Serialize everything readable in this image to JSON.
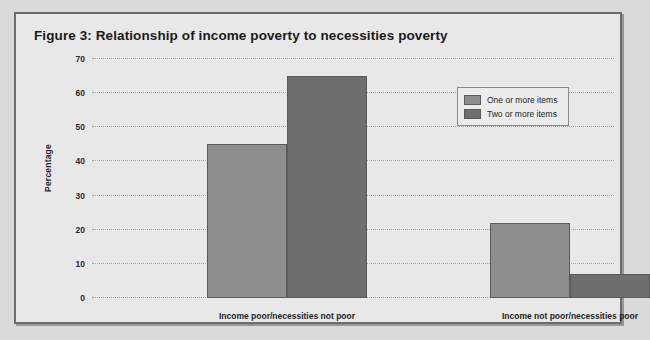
{
  "figure": {
    "title": "Figure 3:  Relationship of income poverty to necessities poverty"
  },
  "chart_data": {
    "type": "bar",
    "title": "Figure 3:  Relationship of income poverty to necessities poverty",
    "xlabel": "",
    "ylabel": "Percentage",
    "ylim": [
      0,
      70
    ],
    "yticks": [
      0,
      10,
      20,
      30,
      40,
      50,
      60,
      70
    ],
    "ytick_labels": [
      "0",
      "10",
      "20",
      "30",
      "40",
      "50",
      "60",
      "70"
    ],
    "grid": true,
    "legend_position": "upper right",
    "categories": [
      "Income poor/necessities not poor",
      "Income not poor/necessities poor"
    ],
    "series": [
      {
        "name": "One or more items",
        "color": "#8e8e8e",
        "values": [
          45,
          22
        ]
      },
      {
        "name": "Two or more items",
        "color": "#6e6e6e",
        "values": [
          65,
          7
        ]
      }
    ]
  }
}
